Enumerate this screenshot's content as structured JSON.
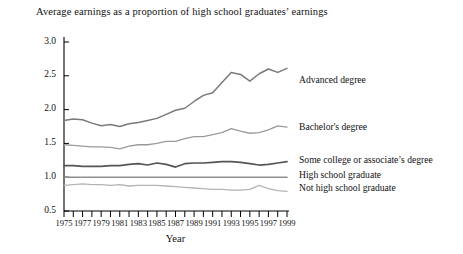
{
  "chart_data": {
    "type": "line",
    "title": "Average earnings as a proportion of high school graduates’ earnings",
    "xlabel": "Year",
    "ylabel": "",
    "xlim": [
      1975,
      1999
    ],
    "ylim": [
      0.5,
      3.0
    ],
    "ytick_labels": [
      "3.0",
      "2.5",
      "2.0",
      "1.5",
      "1.0",
      "0.5"
    ],
    "ytick_values": [
      3.0,
      2.5,
      2.0,
      1.5,
      1.0,
      0.5
    ],
    "xtick_labels": [
      "1975",
      "1977",
      "1979",
      "1981",
      "1983",
      "1985",
      "1987",
      "1989",
      "1991",
      "1993",
      "1995",
      "1997",
      "1999"
    ],
    "xtick_values": [
      1975,
      1977,
      1979,
      1981,
      1983,
      1985,
      1987,
      1989,
      1991,
      1993,
      1995,
      1997,
      1999
    ],
    "minor_ticks_every": 1,
    "grid": false,
    "legend_position": "right-inline",
    "x": [
      1975,
      1976,
      1977,
      1978,
      1979,
      1980,
      1981,
      1982,
      1983,
      1984,
      1985,
      1986,
      1987,
      1988,
      1989,
      1990,
      1991,
      1992,
      1993,
      1994,
      1995,
      1996,
      1997,
      1998,
      1999
    ],
    "series": [
      {
        "name": "Advanced degree",
        "color": "#7a7a7a",
        "width": 1.5,
        "label_x": 1999,
        "values": [
          1.84,
          1.86,
          1.85,
          1.8,
          1.76,
          1.78,
          1.75,
          1.79,
          1.81,
          1.84,
          1.87,
          1.93,
          1.99,
          2.02,
          2.12,
          2.21,
          2.25,
          2.4,
          2.55,
          2.52,
          2.42,
          2.53,
          2.6,
          2.55,
          2.61
        ]
      },
      {
        "name": "Bachelor's degree",
        "color": "#9a9a9a",
        "width": 1.3,
        "label_x": 1999,
        "values": [
          1.48,
          1.47,
          1.46,
          1.45,
          1.45,
          1.44,
          1.42,
          1.46,
          1.48,
          1.48,
          1.5,
          1.53,
          1.53,
          1.57,
          1.6,
          1.6,
          1.63,
          1.66,
          1.72,
          1.68,
          1.65,
          1.66,
          1.7,
          1.76,
          1.74
        ]
      },
      {
        "name": "Some college or associate’s degree",
        "color": "#555555",
        "width": 1.7,
        "label_x": 1999,
        "values": [
          1.17,
          1.17,
          1.16,
          1.16,
          1.16,
          1.17,
          1.17,
          1.19,
          1.2,
          1.18,
          1.21,
          1.19,
          1.15,
          1.2,
          1.21,
          1.21,
          1.22,
          1.23,
          1.23,
          1.22,
          1.2,
          1.18,
          1.19,
          1.21,
          1.23
        ]
      },
      {
        "name": "High school graduate",
        "color": "#8f8f8f",
        "width": 1.5,
        "label_x": 1999,
        "values": [
          1.0,
          1.0,
          1.0,
          1.0,
          1.0,
          1.0,
          1.0,
          1.0,
          1.0,
          1.0,
          1.0,
          1.0,
          1.0,
          1.0,
          1.0,
          1.0,
          1.0,
          1.0,
          1.0,
          1.0,
          1.0,
          1.0,
          1.0,
          1.0,
          1.0
        ]
      },
      {
        "name": "Not high school graduate",
        "color": "#b4b4b4",
        "width": 1.3,
        "label_x": 1999,
        "values": [
          0.88,
          0.89,
          0.9,
          0.89,
          0.89,
          0.88,
          0.89,
          0.87,
          0.88,
          0.88,
          0.88,
          0.87,
          0.86,
          0.85,
          0.84,
          0.83,
          0.82,
          0.82,
          0.81,
          0.81,
          0.82,
          0.88,
          0.83,
          0.8,
          0.79
        ]
      }
    ],
    "series_label_y": {
      "Advanced degree": 2.43,
      "Bachelor's degree": 1.73,
      "Some college or associate’s degree": 1.24,
      "High school graduate": 1.02,
      "Not high school graduate": 0.84
    }
  }
}
